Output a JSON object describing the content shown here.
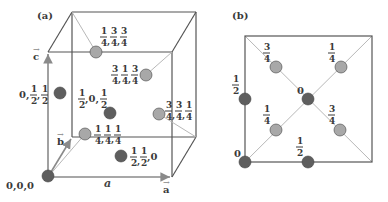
{
  "figure": {
    "panel_a": {
      "label": "(a)",
      "axes": {
        "a_vec": "a",
        "b_vec": "b",
        "c_vec": "c",
        "a_italic": "a"
      },
      "atoms": [
        {
          "coords": [
            "0",
            "0",
            "0"
          ],
          "type": "dark",
          "text": "0,0,0"
        },
        {
          "coords": [
            "0",
            "1/2",
            "1/2"
          ],
          "type": "dark"
        },
        {
          "coords": [
            "1/2",
            "0",
            "1/2"
          ],
          "type": "dark"
        },
        {
          "coords": [
            "1/2",
            "1/2",
            "0"
          ],
          "type": "dark"
        },
        {
          "coords": [
            "1/4",
            "3/4",
            "3/4"
          ],
          "type": "light"
        },
        {
          "coords": [
            "3/4",
            "1/4",
            "3/4"
          ],
          "type": "light"
        },
        {
          "coords": [
            "3/4",
            "3/4",
            "1/4"
          ],
          "type": "light"
        },
        {
          "coords": [
            "1/4",
            "1/4",
            "1/4"
          ],
          "type": "light"
        }
      ]
    },
    "panel_b": {
      "label": "(b)",
      "atoms": [
        {
          "height": "3/4",
          "type": "light"
        },
        {
          "height": "1/4",
          "type": "light"
        },
        {
          "height": "1/2",
          "type": "dark"
        },
        {
          "height": "0",
          "type": "dark"
        },
        {
          "height": "1/4",
          "type": "light"
        },
        {
          "height": "3/4",
          "type": "light"
        },
        {
          "height": "0",
          "type": "dark"
        },
        {
          "height": "1/2",
          "type": "dark"
        }
      ]
    },
    "colors": {
      "dark_atom": "#5e5e5e",
      "light_atom": "#a8a8a8",
      "edge": "#555555",
      "axis": "#8a8a8a",
      "diag": "#b8b8b8"
    }
  }
}
